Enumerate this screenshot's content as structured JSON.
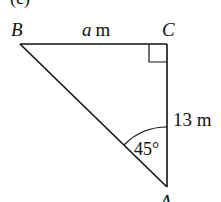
{
  "diagram": {
    "part_label": "(c)",
    "vertices": {
      "B": "B",
      "C": "C",
      "A": "A"
    },
    "side_BC": {
      "variable": "a",
      "unit": "m"
    },
    "side_CA": {
      "value": "13",
      "unit": "m",
      "text": "13 m"
    },
    "angle_A": "45°",
    "right_angle_at": "C",
    "colors": {
      "stroke": "#111111",
      "background": "#ffffff"
    }
  }
}
